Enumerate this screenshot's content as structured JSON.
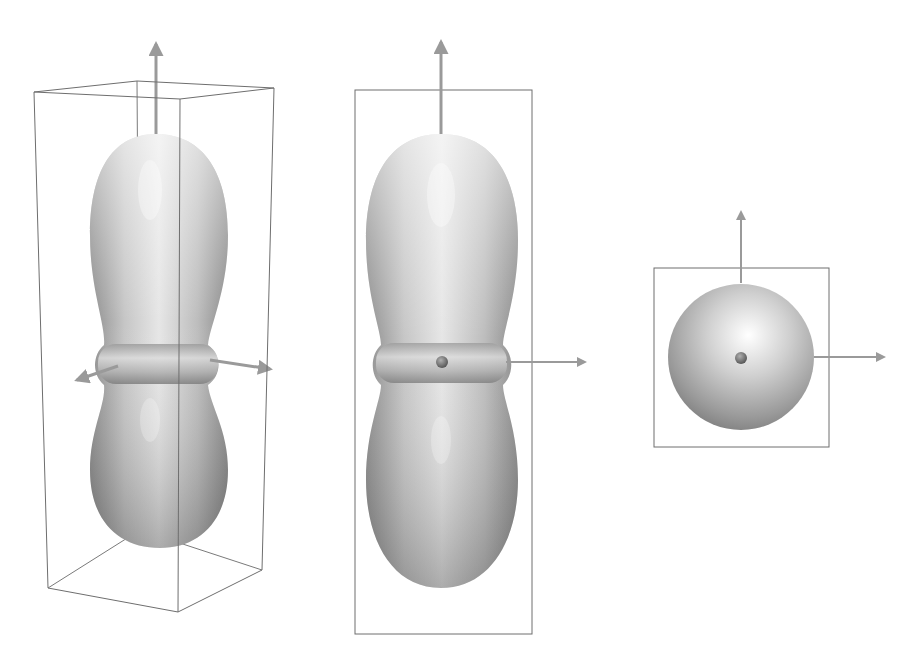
{
  "figure": {
    "panels": [
      {
        "id": "perspective",
        "label": "3D perspective view",
        "shape": "dumbbell",
        "bounding_box": "cuboid-wireframe",
        "axes": [
          "z-up",
          "x-left",
          "y-right"
        ]
      },
      {
        "id": "front",
        "label": "Front view",
        "shape": "dumbbell",
        "bounding_box": "rectangle",
        "axes": [
          "z-up",
          "x-right"
        ],
        "center_marker": true
      },
      {
        "id": "top",
        "label": "Top view",
        "shape": "sphere",
        "bounding_box": "square",
        "axes": [
          "y-up",
          "x-right"
        ],
        "center_marker": true
      }
    ],
    "colors": {
      "surface_light": "#f4f4f4",
      "surface_mid": "#c2c2c2",
      "surface_dark": "#8a8a8a",
      "frame_line": "#6e6e6e",
      "axis": "#9a9a9a",
      "center_marker": "#707070"
    }
  }
}
